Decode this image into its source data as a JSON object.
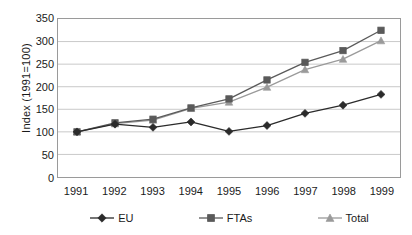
{
  "chart_data": {
    "type": "line",
    "title": "",
    "xlabel": "",
    "ylabel": "Index (1991=100)",
    "categories": [
      "1991",
      "1992",
      "1993",
      "1994",
      "1995",
      "1996",
      "1997",
      "1998",
      "1999"
    ],
    "x": [
      1991,
      1992,
      1993,
      1994,
      1995,
      1996,
      1997,
      1998,
      1999
    ],
    "ylim": [
      0,
      350
    ],
    "yticks": [
      0,
      50,
      100,
      150,
      200,
      250,
      300,
      350
    ],
    "ytick_labels": [
      "0",
      "50",
      "100",
      "150",
      "200",
      "250",
      "300",
      "350"
    ],
    "grid": true,
    "grid_axis": "y",
    "legend_position": "bottom",
    "series": [
      {
        "name": "EU",
        "marker": "diamond",
        "color": "#2b2b2b",
        "values": [
          100,
          117,
          110,
          122,
          101,
          114,
          141,
          159,
          183
        ]
      },
      {
        "name": "FTAs",
        "marker": "square",
        "color": "#5a5a5a",
        "values": [
          100,
          120,
          128,
          153,
          173,
          215,
          254,
          280,
          325
        ]
      },
      {
        "name": "Total",
        "marker": "triangle",
        "color": "#9a9a9a",
        "values": [
          100,
          118,
          126,
          152,
          166,
          199,
          238,
          261,
          302
        ]
      }
    ]
  },
  "legend": {
    "items": [
      {
        "label": "EU"
      },
      {
        "label": "FTAs"
      },
      {
        "label": "Total"
      }
    ]
  },
  "colors": {
    "axis": "#9a9a9a",
    "grid": "#c8c8c8",
    "text": "#1a1a1a",
    "background": "#ffffff",
    "series_eu": "#2b2b2b",
    "series_ftas": "#5a5a5a",
    "series_total": "#9a9a9a"
  }
}
